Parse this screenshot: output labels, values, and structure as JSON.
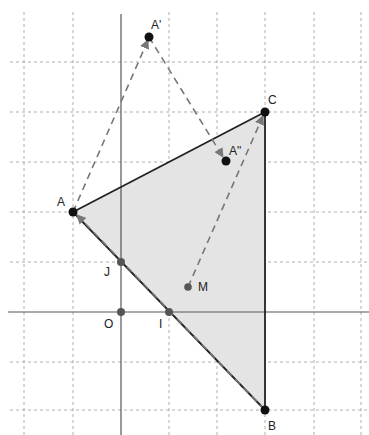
{
  "diagram": {
    "type": "geometry-figure",
    "colors": {
      "grid": "#9a9a9a",
      "axis": "#555555",
      "triangle_fill": "#e4e4e4",
      "triangle_stroke": "#222222",
      "dashed_vector": "#777777",
      "point": "#111111",
      "point_minor": "#555555"
    },
    "axes": {
      "origin_label": "O",
      "unit_x_label": "I",
      "unit_y_label": "J"
    },
    "points": [
      {
        "id": "A",
        "label": "A",
        "x": -1,
        "y": 2
      },
      {
        "id": "B",
        "label": "B",
        "x": 3,
        "y": -2
      },
      {
        "id": "C",
        "label": "C",
        "x": 3,
        "y": 4
      },
      {
        "id": "A1",
        "label": "A'",
        "x": 0.57,
        "y": 5.57
      },
      {
        "id": "A2",
        "label": "A\"",
        "x": 2.15,
        "y": 3.02
      },
      {
        "id": "M",
        "label": "M",
        "x": 1.37,
        "y": 0.5
      },
      {
        "id": "O",
        "label": "O",
        "x": 0,
        "y": 0
      },
      {
        "id": "I",
        "label": "I",
        "x": 1,
        "y": 0
      },
      {
        "id": "J",
        "label": "J",
        "x": 0,
        "y": 1
      }
    ],
    "triangle": {
      "vertices": [
        "A",
        "B",
        "C"
      ]
    },
    "vectors": [
      {
        "from": "A",
        "to": "A1",
        "style": "dashed"
      },
      {
        "from": "A1",
        "to": "A2",
        "style": "dashed"
      },
      {
        "from": "B",
        "to": "A",
        "style": "dashed"
      },
      {
        "from": "M",
        "to": "C",
        "style": "dashed"
      }
    ]
  }
}
